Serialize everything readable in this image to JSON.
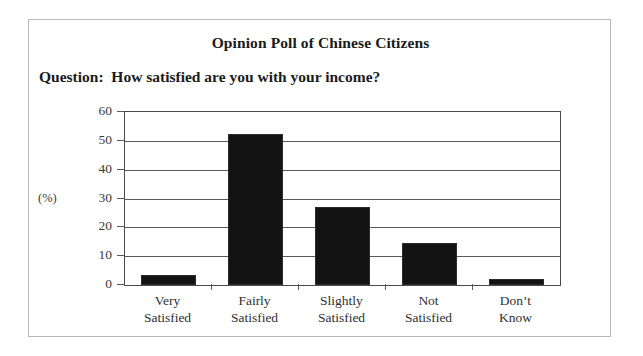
{
  "card": {
    "title": "Opinion Poll of Chinese Citizens",
    "question": "Question:  How satisfied are you with your income?"
  },
  "axis": {
    "y_unit_label": "(%)",
    "y_ticks": [
      "60",
      "50",
      "40",
      "30",
      "20",
      "10",
      "0"
    ]
  },
  "chart_data": {
    "type": "bar",
    "title": "Opinion Poll of Chinese Citizens",
    "subtitle": "Question:  How satisfied are you with your income?",
    "xlabel": "",
    "ylabel": "(%)",
    "ylim": [
      0,
      60
    ],
    "ytick_step": 10,
    "grid": true,
    "legend": false,
    "bar_color": "#131313",
    "categories": [
      "Very Satisfied",
      "Fairly Satisfied",
      "Slightly Satisfied",
      "Not Satisfied",
      "Don’t Know"
    ],
    "category_lines": [
      [
        "Very",
        "Satisfied"
      ],
      [
        "Fairly",
        "Satisfied"
      ],
      [
        "Slightly",
        "Satisfied"
      ],
      [
        "Not",
        "Satisfied"
      ],
      [
        "Don’t",
        "Know"
      ]
    ],
    "values": [
      3.5,
      52.5,
      27,
      14.5,
      2
    ]
  }
}
